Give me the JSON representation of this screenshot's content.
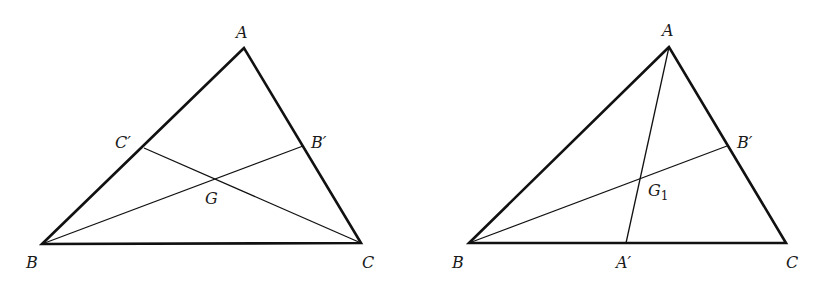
{
  "figures": [
    {
      "id": "left",
      "title": "Triangle ABC with medians BB' and CC' meeting at G",
      "vertices": {
        "A": {
          "x": 244,
          "y": 48,
          "label": "A"
        },
        "B": {
          "x": 42,
          "y": 244,
          "label": "B"
        },
        "C": {
          "x": 361,
          "y": 243,
          "label": "C"
        }
      },
      "points": {
        "C_prime": {
          "x": 144,
          "y": 148,
          "label": "C′"
        },
        "B_prime": {
          "x": 303,
          "y": 146,
          "label": "B′"
        },
        "G": {
          "x": 216,
          "y": 180,
          "label": "G"
        }
      },
      "segments": [
        "B-B'",
        "C-C'"
      ]
    },
    {
      "id": "right",
      "title": "Triangle ABC with medians AA' and BB' meeting at G1",
      "vertices": {
        "A": {
          "x": 669,
          "y": 47,
          "label": "A"
        },
        "B": {
          "x": 469,
          "y": 243,
          "label": "B"
        },
        "C": {
          "x": 786,
          "y": 243,
          "label": "C"
        }
      },
      "points": {
        "A_prime": {
          "x": 626,
          "y": 243,
          "label": "A′"
        },
        "B_prime": {
          "x": 727,
          "y": 146,
          "label": "B′"
        },
        "G1": {
          "x": 641,
          "y": 178,
          "label": "G",
          "subscript": "1"
        }
      },
      "segments": [
        "A-A'",
        "B-B'"
      ]
    }
  ]
}
